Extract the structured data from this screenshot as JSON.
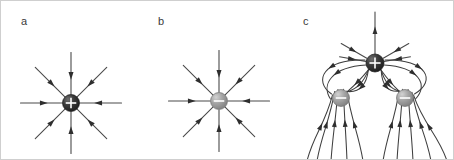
{
  "figure": {
    "background_color": "#ffffff",
    "border_color": "#cfcfcf",
    "width": 454,
    "height": 160,
    "panels": [
      {
        "id": "a",
        "label": "a",
        "label_x": 20,
        "label_y": 24,
        "description": "single positive point charge with eight straight radial field lines",
        "charges": [
          {
            "name": "positive-charge-a",
            "sign": "+",
            "cx": 70,
            "cy": 102,
            "r": 8.5,
            "fill": "#2b2b2b",
            "highlight": "#6e6e6e"
          }
        ],
        "ray_count": 8,
        "ray_length": 42,
        "ray_angles_deg": [
          0,
          45,
          90,
          135,
          180,
          225,
          270,
          315
        ],
        "arrow_direction": "inward",
        "arrow_position_fraction": 0.45
      },
      {
        "id": "b",
        "label": "b",
        "label_x": 157,
        "label_y": 24,
        "description": "single negative point charge with eight straight radial field lines",
        "charges": [
          {
            "name": "negative-charge-b",
            "sign": "-",
            "cx": 218,
            "cy": 100,
            "r": 8.5,
            "fill": "#9a9a9a",
            "highlight": "#c9c9c9"
          }
        ],
        "ray_count": 8,
        "ray_length": 42,
        "ray_angles_deg": [
          0,
          45,
          90,
          135,
          180,
          225,
          270,
          315
        ],
        "arrow_direction": "inward",
        "arrow_position_fraction": 0.45
      },
      {
        "id": "c",
        "label": "c",
        "label_x": 302,
        "label_y": 24,
        "description": "one positive charge above two negative charges with curved field lines running from the positive charge to each negative charge and outward to the edges",
        "charges": [
          {
            "name": "positive-charge-c",
            "sign": "+",
            "cx": 374,
            "cy": 62,
            "r": 9,
            "fill": "#2b2b2b",
            "highlight": "#6e6e6e"
          },
          {
            "name": "negative-charge-c-left",
            "sign": "-",
            "cx": 340,
            "cy": 97,
            "r": 8.5,
            "fill": "#9a9a9a",
            "highlight": "#c9c9c9"
          },
          {
            "name": "negative-charge-c-right",
            "sign": "-",
            "cx": 404,
            "cy": 97,
            "r": 8.5,
            "fill": "#9a9a9a",
            "highlight": "#c9c9c9"
          }
        ],
        "top_rays": [
          {
            "angle_deg": 270,
            "length": 42
          },
          {
            "angle_deg": 210,
            "length": 30
          },
          {
            "angle_deg": 330,
            "length": 30
          },
          {
            "angle_deg": 190,
            "length": 27
          },
          {
            "angle_deg": 350,
            "length": 27
          }
        ],
        "connector_curves": [
          {
            "from": "positive-charge-c",
            "to": "negative-charge-c-left",
            "bow": 14
          },
          {
            "from": "positive-charge-c",
            "to": "negative-charge-c-left",
            "bow": 7
          },
          {
            "from": "positive-charge-c",
            "to": "negative-charge-c-left",
            "bow": 0
          },
          {
            "from": "positive-charge-c",
            "to": "negative-charge-c-right",
            "bow": -14
          },
          {
            "from": "positive-charge-c",
            "to": "negative-charge-c-right",
            "bow": -7
          },
          {
            "from": "positive-charge-c",
            "to": "negative-charge-c-right",
            "bow": 0
          }
        ],
        "outer_curves_count": 10,
        "arrow_direction": "from-positive-to-negative"
      }
    ]
  }
}
